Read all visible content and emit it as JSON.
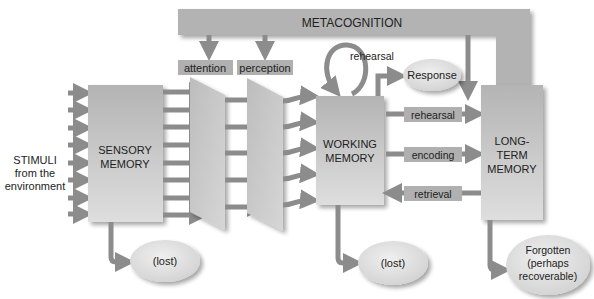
{
  "diagram": {
    "type": "information-processing-model",
    "colors": {
      "box": "#b8b8b8",
      "box_light": "#d8d8d8",
      "arrow": "#8c8c8c",
      "label_bg": "#b0b0b0",
      "text": "#222222",
      "ellipse": "#e2e2e2"
    },
    "metacognition": {
      "label": "METACOGNITION"
    },
    "stimuli": {
      "line1": "STIMULI",
      "line2": "from the",
      "line3": "environment"
    },
    "sensory_memory": {
      "line1": "SENSORY",
      "line2": "MEMORY"
    },
    "attention": {
      "label": "attention"
    },
    "perception": {
      "label": "perception"
    },
    "working_memory": {
      "line1": "WORKING",
      "line2": "MEMORY"
    },
    "long_term_memory": {
      "line1": "LONG-",
      "line2": "TERM",
      "line3": "MEMORY"
    },
    "rehearsal_loop": {
      "label": "rehearsal"
    },
    "response": {
      "label": "Response"
    },
    "transfers": {
      "rehearsal": "rehearsal",
      "encoding": "encoding",
      "retrieval": "retrieval"
    },
    "outcomes": {
      "sensory_lost": "(lost)",
      "working_lost": "(lost)",
      "forgotten_line1": "Forgotten",
      "forgotten_line2": "(perhaps",
      "forgotten_line3": "recoverable)"
    }
  }
}
